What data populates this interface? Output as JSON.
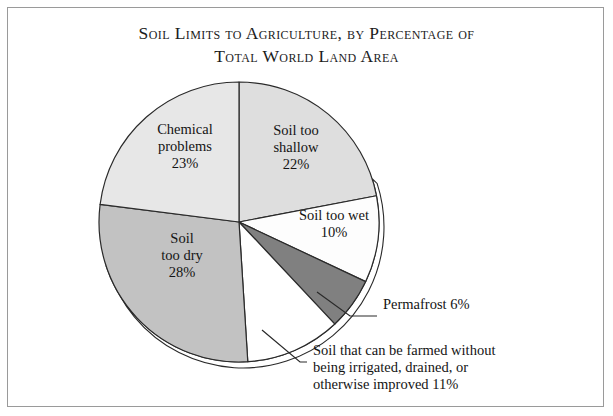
{
  "title": {
    "line1": "Soil Limits to Agriculture, by Percentage of",
    "line2": "Total World Land Area"
  },
  "chart_data": {
    "type": "pie",
    "title": "Soil Limits to Agriculture, by Percentage of Total World Land Area",
    "unit": "percent of total world land area",
    "total": 100,
    "legend": "none",
    "start_angle_deg": 0,
    "direction": "clockwise",
    "categories": [
      "Soil too shallow",
      "Soil too wet",
      "Permafrost",
      "Soil that can be farmed without being irrigated, drained, or otherwise improved",
      "Soil too dry",
      "Chemical problems"
    ],
    "values": [
      22,
      10,
      6,
      11,
      28,
      23
    ],
    "colors": [
      "#dedede",
      "#fdfdfd",
      "#808080",
      "#ffffff",
      "#c2c2c2",
      "#e7e7e7"
    ],
    "slices": [
      {
        "name": "soil-too-shallow",
        "label_line1": "Soil too",
        "label_line2": "shallow",
        "value_label": "22%",
        "value": 22,
        "color": "#dedede",
        "label_placement": "inside",
        "label_x": 296,
        "label_y": 135
      },
      {
        "name": "soil-too-wet",
        "label_line1": "Soil too wet",
        "label_line2": "",
        "value_label": "10%",
        "value": 10,
        "color": "#fdfdfd",
        "label_placement": "inside",
        "label_x": 334,
        "label_y": 220
      },
      {
        "name": "permafrost",
        "label_line1": "Permafrost 6%",
        "label_line2": "",
        "value_label": "6%",
        "value": 6,
        "color": "#808080",
        "label_placement": "outside",
        "label_x": 383,
        "label_y": 309
      },
      {
        "name": "soil-that-can-be-farmed",
        "label_line1": "Soil that can be farmed without",
        "label_line2": "being irrigated, drained, or",
        "label_line3": "otherwise improved 11%",
        "value_label": "11%",
        "value": 11,
        "color": "#ffffff",
        "label_placement": "outside",
        "label_x": 313,
        "label_y": 355
      },
      {
        "name": "soil-too-dry",
        "label_line1": "Soil",
        "label_line2": "too dry",
        "value_label": "28%",
        "value": 28,
        "color": "#c2c2c2",
        "label_placement": "inside",
        "label_x": 182,
        "label_y": 243
      },
      {
        "name": "chemical-problems",
        "label_line1": "Chemical",
        "label_line2": "problems",
        "value_label": "23%",
        "value": 23,
        "color": "#e7e7e7",
        "label_placement": "inside",
        "label_x": 185,
        "label_y": 134
      }
    ]
  }
}
